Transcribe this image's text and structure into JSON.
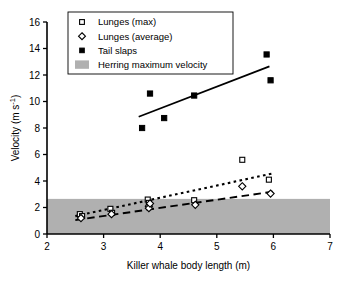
{
  "chart_data": {
    "type": "scatter",
    "title": "",
    "xlabel": "Killer whale body length (m)",
    "ylabel": "Velocity (m s⁻¹)",
    "xlim": [
      2,
      7
    ],
    "ylim": [
      0,
      16
    ],
    "xticks": [
      "2",
      "3",
      "4",
      "5",
      "6",
      "7"
    ],
    "yticks": [
      "0",
      "2",
      "4",
      "6",
      "8",
      "10",
      "12",
      "14",
      "16"
    ],
    "grid": false,
    "legend_position": "top-center",
    "legend": [
      {
        "label": "Lunges (max)",
        "marker": "open-square"
      },
      {
        "label": "Lunges (average)",
        "marker": "open-diamond"
      },
      {
        "label": "Tail slaps",
        "marker": "filled-square"
      },
      {
        "label": "Herring maximum velocity",
        "marker": "gray-band-swatch"
      }
    ],
    "series": [
      {
        "name": "Lunges (max)",
        "marker": "open-square",
        "points": [
          {
            "x": 2.58,
            "y": 1.5
          },
          {
            "x": 2.62,
            "y": 1.35
          },
          {
            "x": 3.12,
            "y": 1.9
          },
          {
            "x": 3.15,
            "y": 1.6
          },
          {
            "x": 3.78,
            "y": 2.6
          },
          {
            "x": 3.8,
            "y": 2.35
          },
          {
            "x": 4.6,
            "y": 2.55
          },
          {
            "x": 5.45,
            "y": 5.6
          },
          {
            "x": 5.92,
            "y": 4.1
          }
        ]
      },
      {
        "name": "Lunges (average)",
        "marker": "open-diamond",
        "points": [
          {
            "x": 2.6,
            "y": 1.2
          },
          {
            "x": 3.14,
            "y": 1.5
          },
          {
            "x": 3.8,
            "y": 2.1
          },
          {
            "x": 3.8,
            "y": 1.95
          },
          {
            "x": 3.82,
            "y": 2.3
          },
          {
            "x": 4.62,
            "y": 2.2
          },
          {
            "x": 5.45,
            "y": 3.6
          },
          {
            "x": 5.95,
            "y": 3.05
          }
        ]
      },
      {
        "name": "Tail slaps",
        "marker": "filled-square",
        "points": [
          {
            "x": 3.68,
            "y": 8.0
          },
          {
            "x": 3.82,
            "y": 10.6
          },
          {
            "x": 4.07,
            "y": 8.75
          },
          {
            "x": 4.6,
            "y": 10.45
          },
          {
            "x": 5.88,
            "y": 13.55
          },
          {
            "x": 5.95,
            "y": 11.6
          }
        ]
      }
    ],
    "trendlines": [
      {
        "name": "Tail slaps trend",
        "style": "solid",
        "x1": 3.62,
        "y1": 8.85,
        "x2": 5.93,
        "y2": 12.65
      },
      {
        "name": "Lunges (max) trend",
        "style": "dotted",
        "x1": 2.5,
        "y1": 1.35,
        "x2": 6.02,
        "y2": 4.6
      },
      {
        "name": "Lunges (average) trend",
        "style": "dashed",
        "x1": 2.5,
        "y1": 1.05,
        "x2": 6.0,
        "y2": 3.2
      }
    ],
    "bands": [
      {
        "name": "Herring maximum velocity",
        "y_from": 0,
        "y_to": 2.65,
        "color": "#b0b0b0"
      }
    ],
    "colors": {
      "axis": "#000000",
      "marker": "#000000",
      "band": "#b0b0b0",
      "background": "#ffffff"
    }
  }
}
